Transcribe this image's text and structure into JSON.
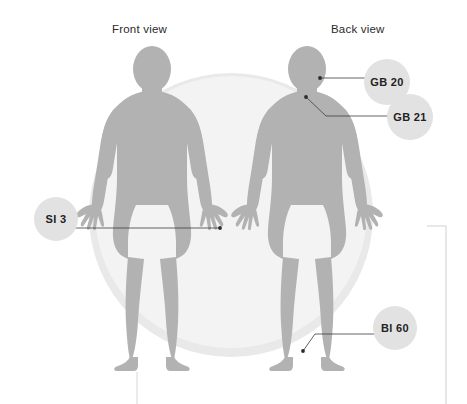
{
  "diagram": {
    "titles": {
      "front": "Front view",
      "back": "Back view"
    },
    "colors": {
      "body_fill": "#b2b2b2",
      "background_circle": "#f2f2f2",
      "background_circle_ring": "#e8e8e8",
      "callout_fill": "#e2e2e2",
      "leader_line": "#3c3c3c",
      "bracket": "#e0e0e0",
      "text": "#222222",
      "page_background": "#ffffff"
    },
    "callouts": [
      {
        "id": "gb20",
        "label": "GB 20",
        "view": "back",
        "target": "base of skull / occiput",
        "point_x": 320,
        "point_y": 78,
        "badge_x": 387,
        "badge_y": 82
      },
      {
        "id": "gb21",
        "label": "GB 21",
        "view": "back",
        "target": "top of shoulder / trapezius",
        "point_x": 306,
        "point_y": 97,
        "badge_x": 410,
        "badge_y": 117
      },
      {
        "id": "si3",
        "label": "SI 3",
        "view": "front",
        "target": "ulnar side of hand",
        "point_x": 220,
        "point_y": 228,
        "badge_x": 56,
        "badge_y": 219
      },
      {
        "id": "bl60",
        "label": "Bl 60",
        "view": "back",
        "target": "outer ankle / achilles",
        "point_x": 303,
        "point_y": 350,
        "badge_x": 395,
        "badge_y": 328
      }
    ],
    "figures": [
      {
        "id": "front-figure",
        "view": "front",
        "center_x": 152,
        "label": "female body silhouette front"
      },
      {
        "id": "back-figure",
        "view": "back",
        "center_x": 307,
        "label": "female body silhouette back"
      }
    ],
    "decorations": {
      "bracket_right": "thin right-edge bracket rule",
      "tick_bottom_left": "short vertical tick mark bottom left"
    }
  }
}
